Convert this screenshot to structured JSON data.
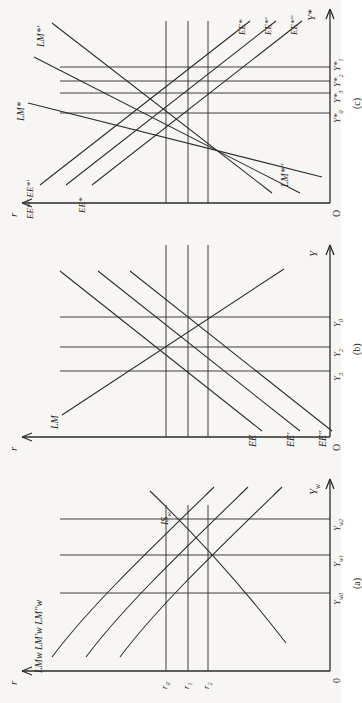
{
  "figure": {
    "type": "diagram",
    "rotation_deg": -90,
    "panels": [
      {
        "id": "a",
        "caption": "(a)",
        "y_axis_label": "r",
        "x_axis_label": "Yw",
        "origin_label": "0",
        "curves": [
          {
            "name": "LMw",
            "label": "LM",
            "sub": "w",
            "prime": ""
          },
          {
            "name": "LMwp",
            "label": "LM",
            "sub": "w",
            "prime": "'"
          },
          {
            "name": "LMwpp",
            "label": "LM",
            "sub": "w",
            "prime": "''"
          },
          {
            "name": "ISw",
            "label": "IS",
            "sub": "w",
            "prime": ""
          }
        ],
        "curve_group_label": "LMw LM'w LM''w",
        "y_ticks": [
          {
            "label": "r",
            "sub": "0"
          },
          {
            "label": "r",
            "sub": "1"
          },
          {
            "label": "r",
            "sub": "2"
          }
        ],
        "x_ticks": [
          {
            "label": "Y",
            "sub": "w0"
          },
          {
            "label": "Y",
            "sub": "w1"
          },
          {
            "label": "Y",
            "sub": "w2"
          }
        ]
      },
      {
        "id": "b",
        "caption": "(b)",
        "y_axis_label": "r",
        "x_axis_label": "Y",
        "origin_label": "O",
        "curves": [
          {
            "name": "EE",
            "label": "EE",
            "prime": ""
          },
          {
            "name": "EEp",
            "label": "EE",
            "prime": "'"
          },
          {
            "name": "EEpp",
            "label": "EE",
            "prime": "''"
          },
          {
            "name": "LM",
            "label": "LM",
            "prime": ""
          }
        ],
        "x_ticks": [
          {
            "label": "Y",
            "sub": "3"
          },
          {
            "label": "Y",
            "sub": "2"
          },
          {
            "label": "Y",
            "sub": "0"
          }
        ]
      },
      {
        "id": "c",
        "caption": "(c)",
        "y_axis_label": "r",
        "x_axis_label": "Y*",
        "origin_label": "O",
        "curves": [
          {
            "name": "EEstar",
            "label": "EE*",
            "prime": ""
          },
          {
            "name": "EEstarp",
            "label": "EE*",
            "prime": "'"
          },
          {
            "name": "EEstarpp",
            "label": "EE*",
            "prime": "''"
          },
          {
            "name": "LMstar",
            "label": "LM*",
            "prime": ""
          },
          {
            "name": "LMstarp",
            "label": "LM*",
            "prime": "'"
          },
          {
            "name": "LMstarpp",
            "label": "LM*",
            "prime": "''"
          }
        ],
        "left_curve_group_label": "EE*'' EE*'",
        "x_ticks": [
          {
            "label": "Y*",
            "sub": "0"
          },
          {
            "label": "Y*",
            "sub": "3"
          },
          {
            "label": "Y*",
            "sub": "2"
          },
          {
            "label": "Y*",
            "sub": "1"
          }
        ]
      }
    ],
    "colors": {
      "ink": "#2b2b2b",
      "paper": "#f7f6f3"
    }
  }
}
